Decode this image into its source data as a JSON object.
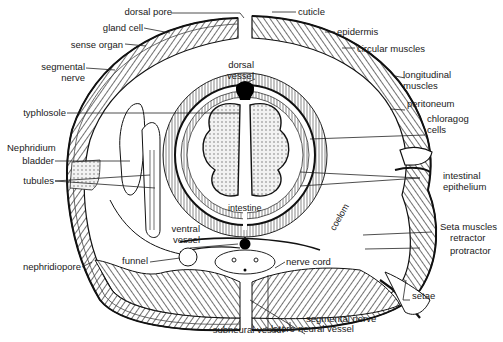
{
  "figure": {
    "colors": {
      "ink": "#1a1a1a",
      "background": "#ffffff",
      "fill_gray": "#c8c8c8"
    }
  },
  "labels": {
    "dorsal_pore": "dorsal pore",
    "gland_cell": "gland cell",
    "sense_organ": "sense organ",
    "segmental_nerve_left": [
      "segmental",
      "nerve"
    ],
    "dorsal_vessel": [
      "dorsal",
      "vessel"
    ],
    "typhlosole": "typhlosole",
    "nephridium": "Nephridium",
    "bladder": "bladder",
    "tubules": "tubules",
    "ventral_vessel": [
      "ventral",
      "vessel"
    ],
    "funnel": "funnel",
    "nephridiopore": "nephridiopore",
    "subneural_vessel": "subneural vessel",
    "intestine": "intestine",
    "coelom": "coelom",
    "nerve_cord": "nerve cord",
    "latero_neural_vessel": "latero-neural vessel",
    "segmental_nerve_right": "segmental nerve",
    "cuticle": "cuticle",
    "epidermis": "epidermis",
    "circular_muscles": "circular muscles",
    "longitudinal_muscles": [
      "longitudinal",
      "muscles"
    ],
    "peritoneum": "peritoneum",
    "chloragog_cells": [
      "chloragog",
      "cells"
    ],
    "intestinal_epithelium": [
      "intestinal",
      "epithelium"
    ],
    "seta_muscles": "Seta muscles",
    "retractor": "retractor",
    "protractor": "protractor",
    "setae": "setae"
  }
}
